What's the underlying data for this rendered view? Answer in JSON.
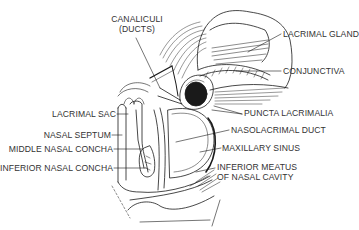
{
  "figure": {
    "labels": {
      "canaliculi_line1": "CANALICULI",
      "canaliculi_line2": "(DUCTS)",
      "lacrimal_gland": "LACRIMAL GLAND",
      "conjunctiva": "CONJUNCTIVA",
      "puncta_lacrimalia": "PUNCTA LACRIMALIA",
      "nasolacrimal_duct": "NASOLACRIMAL DUCT",
      "maxillary_sinus": "MAXILLARY SINUS",
      "inferior_meatus_line1": "INFERIOR MEATUS",
      "inferior_meatus_line2": "OF NASAL CAVITY",
      "lacrimal_sac": "LACRIMAL SAC",
      "nasal_septum": "NASAL SEPTUM",
      "middle_nasal_concha": "MIDDLE NASAL CONCHA",
      "inferior_nasal_concha": "INFERIOR NASAL CONCHA"
    },
    "colors": {
      "ink": "#1a1a1a",
      "label": "#333333",
      "background": "#ffffff"
    }
  }
}
